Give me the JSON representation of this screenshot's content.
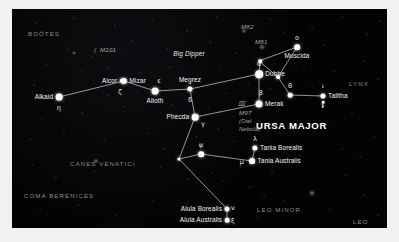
{
  "chart_data": {
    "type": "scatter",
    "subtitle": "The Big Dipper and surrounding constellations",
    "xlabel": "",
    "ylabel": "",
    "grid": false,
    "legend_position": "none",
    "axis_note": "Sky chart; positions are plotted in arbitrary chart pixel coordinates",
    "xlim": [
      0,
      375
    ],
    "ylim": [
      0,
      219
    ],
    "constellation_labels": [
      {
        "name": "BOÖTES",
        "x": 16,
        "y": 22
      },
      {
        "name": "CANES VENATICI",
        "x": 58,
        "y": 152
      },
      {
        "name": "COMA BERENICES",
        "x": 12,
        "y": 184
      },
      {
        "name": "LYNX",
        "x": 337,
        "y": 72
      },
      {
        "name": "LEO MINOR",
        "x": 245,
        "y": 198
      },
      {
        "name": "LEO",
        "x": 341,
        "y": 210
      },
      {
        "name": "URSA MAJOR",
        "x": 244,
        "y": 112
      }
    ],
    "deep_sky_objects": [
      {
        "name": "M101",
        "x": 88,
        "y": 38,
        "style": "messier"
      },
      {
        "name": "M82",
        "x": 229,
        "y": 15,
        "style": "messier"
      },
      {
        "name": "M81",
        "x": 243,
        "y": 30,
        "style": "messier"
      },
      {
        "name": "M97",
        "x": 227,
        "y": 101,
        "style": "messier"
      },
      {
        "name": "(Owl",
        "x": 227,
        "y": 109,
        "style": "nebname"
      },
      {
        "name": "Nebula)",
        "x": 227,
        "y": 117,
        "style": "nebname"
      }
    ],
    "asterism_label": {
      "name": "Big Dipper",
      "x": 177,
      "y": 45
    },
    "stars": [
      {
        "name": "Alkaid",
        "greek": "η",
        "x": 47,
        "y": 88,
        "mag_r": 3.4,
        "label_side": "left",
        "greek_dx": 0,
        "greek_dy": 11
      },
      {
        "name": "Alcor",
        "greek": "",
        "x": 110,
        "y": 72,
        "mag_r": 2.2,
        "label_side": "left",
        "greek_dx": 0,
        "greek_dy": 0
      },
      {
        "name": "Mizar",
        "greek": "ζ",
        "x": 112,
        "y": 72,
        "mag_r": 3.1,
        "label_side": "right",
        "greek_dx": -4,
        "greek_dy": 11
      },
      {
        "name": "Alioth",
        "greek": "ε",
        "x": 143,
        "y": 82,
        "mag_r": 3.4,
        "label_side": "below",
        "greek_dx": 4,
        "greek_dy": -10
      },
      {
        "name": "Megrez",
        "greek": "δ",
        "x": 178,
        "y": 80,
        "mag_r": 2.6,
        "label_side": "above",
        "greek_dx": 0,
        "greek_dy": 11
      },
      {
        "name": "Phecda",
        "greek": "γ",
        "x": 183,
        "y": 108,
        "mag_r": 3.3,
        "label_side": "left",
        "greek_dx": 8,
        "greek_dy": 7
      },
      {
        "name": "Dubhe",
        "greek": "α",
        "x": 247,
        "y": 65,
        "mag_r": 3.8,
        "label_side": "right",
        "greek_dx": 0,
        "greek_dy": -10
      },
      {
        "name": "Merak",
        "greek": "β",
        "x": 247,
        "y": 95,
        "mag_r": 3.5,
        "label_side": "right",
        "greek_dx": 2,
        "greek_dy": -11
      },
      {
        "name": "Muscida",
        "greek": "ο",
        "x": 285,
        "y": 38,
        "mag_r": 2.8,
        "label_side": "below",
        "greek_dx": 0,
        "greek_dy": -9
      },
      {
        "name": "Talitha",
        "greek": "ι",
        "x": 311,
        "y": 87,
        "mag_r": 2.6,
        "label_side": "right",
        "greek_dx": 0,
        "greek_dy": -10
      },
      {
        "name": "Tania Borealis",
        "greek": "λ",
        "x": 243,
        "y": 139,
        "mag_r": 2.6,
        "label_side": "right",
        "greek_dx": 0,
        "greek_dy": -9
      },
      {
        "name": "Tania Australis",
        "greek": "μ",
        "x": 240,
        "y": 152,
        "mag_r": 2.9,
        "label_side": "right",
        "greek_dx": -10,
        "greek_dy": 1
      },
      {
        "name": "Alula Borealis",
        "greek": "ν",
        "x": 215,
        "y": 200,
        "mag_r": 2.5,
        "label_side": "left",
        "greek_dx": 6,
        "greek_dy": -1
      },
      {
        "name": "Alula Australis",
        "greek": "ξ",
        "x": 215,
        "y": 211,
        "mag_r": 2.3,
        "label_side": "left",
        "greek_dx": 6,
        "greek_dy": 1
      },
      {
        "name": "",
        "greek": "ψ",
        "x": 189,
        "y": 145,
        "mag_r": 2.8,
        "label_side": "below",
        "greek_dx": 0,
        "greek_dy": -9
      },
      {
        "name": "",
        "greek": "θ",
        "x": 278,
        "y": 86,
        "mag_r": 2.3,
        "label_side": "below",
        "greek_dx": 0,
        "greek_dy": -9
      },
      {
        "name": "",
        "greek": "",
        "x": 248,
        "y": 52,
        "mag_r": 1.8,
        "label_side": "none",
        "greek_dx": 0,
        "greek_dy": 0
      },
      {
        "name": "",
        "greek": "",
        "x": 266,
        "y": 68,
        "mag_r": 1.9,
        "label_side": "none",
        "greek_dx": 0,
        "greek_dy": 0
      },
      {
        "name": "",
        "greek": "",
        "x": 167,
        "y": 150,
        "mag_r": 1.6,
        "label_side": "none",
        "greek_dx": 0,
        "greek_dy": 0
      }
    ],
    "constellation_lines": [
      {
        "from": [
          47,
          88
        ],
        "to": [
          112,
          72
        ]
      },
      {
        "from": [
          112,
          72
        ],
        "to": [
          143,
          82
        ]
      },
      {
        "from": [
          143,
          82
        ],
        "to": [
          178,
          80
        ]
      },
      {
        "from": [
          178,
          80
        ],
        "to": [
          247,
          65
        ]
      },
      {
        "from": [
          178,
          80
        ],
        "to": [
          183,
          108
        ]
      },
      {
        "from": [
          183,
          108
        ],
        "to": [
          247,
          95
        ]
      },
      {
        "from": [
          247,
          65
        ],
        "to": [
          247,
          95
        ]
      },
      {
        "from": [
          247,
          52
        ],
        "to": [
          285,
          38
        ]
      },
      {
        "from": [
          247,
          52
        ],
        "to": [
          266,
          68
        ]
      },
      {
        "from": [
          247,
          65
        ],
        "to": [
          248,
          52
        ]
      },
      {
        "from": [
          266,
          68
        ],
        "to": [
          285,
          38
        ]
      },
      {
        "from": [
          266,
          68
        ],
        "to": [
          278,
          86
        ]
      },
      {
        "from": [
          278,
          86
        ],
        "to": [
          311,
          87
        ]
      },
      {
        "from": [
          183,
          108
        ],
        "to": [
          167,
          150
        ]
      },
      {
        "from": [
          167,
          150
        ],
        "to": [
          189,
          145
        ]
      },
      {
        "from": [
          189,
          145
        ],
        "to": [
          240,
          152
        ]
      },
      {
        "from": [
          240,
          152
        ],
        "to": [
          243,
          139
        ]
      },
      {
        "from": [
          167,
          150
        ],
        "to": [
          215,
          200
        ]
      },
      {
        "from": [
          215,
          200
        ],
        "to": [
          215,
          211
        ]
      }
    ]
  },
  "background_stars": [
    {
      "x": 24,
      "y": 14,
      "r": 0.5
    },
    {
      "x": 62,
      "y": 9,
      "r": 0.4
    },
    {
      "x": 103,
      "y": 16,
      "r": 0.5
    },
    {
      "x": 140,
      "y": 12,
      "r": 0.4
    },
    {
      "x": 175,
      "y": 22,
      "r": 0.5
    },
    {
      "x": 205,
      "y": 8,
      "r": 0.4
    },
    {
      "x": 258,
      "y": 10,
      "r": 0.5
    },
    {
      "x": 300,
      "y": 18,
      "r": 0.4
    },
    {
      "x": 330,
      "y": 8,
      "r": 0.6
    },
    {
      "x": 355,
      "y": 25,
      "r": 0.5
    },
    {
      "x": 368,
      "y": 12,
      "r": 0.4
    },
    {
      "x": 312,
      "y": 36,
      "r": 0.5
    },
    {
      "x": 272,
      "y": 24,
      "r": 0.4
    },
    {
      "x": 224,
      "y": 44,
      "r": 0.5
    },
    {
      "x": 198,
      "y": 33,
      "r": 0.4
    },
    {
      "x": 155,
      "y": 40,
      "r": 0.5
    },
    {
      "x": 120,
      "y": 32,
      "r": 0.4
    },
    {
      "x": 80,
      "y": 48,
      "r": 0.5
    },
    {
      "x": 56,
      "y": 40,
      "r": 0.45
    },
    {
      "x": 34,
      "y": 56,
      "r": 0.5
    },
    {
      "x": 22,
      "y": 76,
      "r": 0.4
    },
    {
      "x": 70,
      "y": 62,
      "r": 0.45
    },
    {
      "x": 96,
      "y": 58,
      "r": 0.4
    },
    {
      "x": 128,
      "y": 64,
      "r": 0.5
    },
    {
      "x": 158,
      "y": 58,
      "r": 0.4
    },
    {
      "x": 208,
      "y": 60,
      "r": 0.45
    },
    {
      "x": 292,
      "y": 58,
      "r": 0.5
    },
    {
      "x": 322,
      "y": 62,
      "r": 0.4
    },
    {
      "x": 352,
      "y": 52,
      "r": 0.5
    },
    {
      "x": 366,
      "y": 70,
      "r": 0.4
    },
    {
      "x": 300,
      "y": 78,
      "r": 0.45
    },
    {
      "x": 258,
      "y": 80,
      "r": 0.4
    },
    {
      "x": 214,
      "y": 84,
      "r": 0.45
    },
    {
      "x": 160,
      "y": 96,
      "r": 0.4
    },
    {
      "x": 112,
      "y": 98,
      "r": 0.5
    },
    {
      "x": 70,
      "y": 104,
      "r": 0.4
    },
    {
      "x": 30,
      "y": 110,
      "r": 0.45
    },
    {
      "x": 18,
      "y": 130,
      "r": 0.4
    },
    {
      "x": 52,
      "y": 124,
      "r": 0.5
    },
    {
      "x": 92,
      "y": 132,
      "r": 0.4
    },
    {
      "x": 136,
      "y": 124,
      "r": 0.45
    },
    {
      "x": 206,
      "y": 120,
      "r": 0.4
    },
    {
      "x": 268,
      "y": 124,
      "r": 0.5
    },
    {
      "x": 306,
      "y": 116,
      "r": 0.4
    },
    {
      "x": 340,
      "y": 104,
      "r": 0.5
    },
    {
      "x": 362,
      "y": 128,
      "r": 0.45
    },
    {
      "x": 330,
      "y": 140,
      "r": 0.4
    },
    {
      "x": 288,
      "y": 146,
      "r": 0.5
    },
    {
      "x": 260,
      "y": 162,
      "r": 0.4
    },
    {
      "x": 222,
      "y": 132,
      "r": 0.45
    },
    {
      "x": 200,
      "y": 164,
      "r": 0.4
    },
    {
      "x": 176,
      "y": 170,
      "r": 0.5
    },
    {
      "x": 148,
      "y": 158,
      "r": 0.4
    },
    {
      "x": 118,
      "y": 170,
      "r": 0.45
    },
    {
      "x": 82,
      "y": 162,
      "r": 0.4
    },
    {
      "x": 44,
      "y": 168,
      "r": 0.5
    },
    {
      "x": 20,
      "y": 156,
      "r": 0.4
    },
    {
      "x": 28,
      "y": 200,
      "r": 0.45
    },
    {
      "x": 66,
      "y": 196,
      "r": 0.4
    },
    {
      "x": 104,
      "y": 206,
      "r": 0.5
    },
    {
      "x": 140,
      "y": 192,
      "r": 0.4
    },
    {
      "x": 172,
      "y": 212,
      "r": 0.45
    },
    {
      "x": 196,
      "y": 186,
      "r": 0.4
    },
    {
      "x": 238,
      "y": 178,
      "r": 0.5
    },
    {
      "x": 272,
      "y": 192,
      "r": 0.4
    },
    {
      "x": 300,
      "y": 184,
      "r": 0.55
    },
    {
      "x": 318,
      "y": 200,
      "r": 0.45
    },
    {
      "x": 352,
      "y": 186,
      "r": 0.5
    },
    {
      "x": 366,
      "y": 206,
      "r": 0.4
    },
    {
      "x": 246,
      "y": 208,
      "r": 0.45
    },
    {
      "x": 210,
      "y": 172,
      "r": 0.4
    },
    {
      "x": 184,
      "y": 128,
      "r": 0.45
    },
    {
      "x": 152,
      "y": 140,
      "r": 0.4
    },
    {
      "x": 228,
      "y": 158,
      "r": 0.4
    },
    {
      "x": 252,
      "y": 186,
      "r": 0.4
    },
    {
      "x": 334,
      "y": 166,
      "r": 0.5
    },
    {
      "x": 348,
      "y": 148,
      "r": 0.4
    },
    {
      "x": 196,
      "y": 100,
      "r": 0.4
    },
    {
      "x": 236,
      "y": 76,
      "r": 0.4
    },
    {
      "x": 126,
      "y": 82,
      "r": 0.4
    },
    {
      "x": 96,
      "y": 86,
      "r": 0.4
    }
  ],
  "glow_objects": [
    {
      "x": 232,
      "y": 22,
      "w": 7,
      "h": 4,
      "name": "m82-galaxy"
    },
    {
      "x": 250,
      "y": 38,
      "w": 8,
      "h": 6,
      "name": "m81-galaxy"
    },
    {
      "x": 84,
      "y": 152,
      "w": 6,
      "h": 6,
      "name": "canes-venatici-glow"
    },
    {
      "x": 300,
      "y": 184,
      "w": 7,
      "h": 7,
      "name": "leo-glow"
    },
    {
      "x": 62,
      "y": 44,
      "w": 5,
      "h": 4,
      "name": "m101-galaxy"
    }
  ]
}
